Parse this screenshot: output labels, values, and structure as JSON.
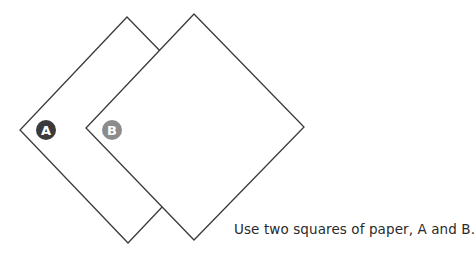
{
  "diagram": {
    "squares": [
      {
        "id": "A",
        "label": "A",
        "badge_color": "#3b3b3b"
      },
      {
        "id": "B",
        "label": "B",
        "badge_color": "#8c8c8c"
      }
    ],
    "stroke_color": "#3a3a3a",
    "caption": "Use two squares of paper, A and B."
  }
}
